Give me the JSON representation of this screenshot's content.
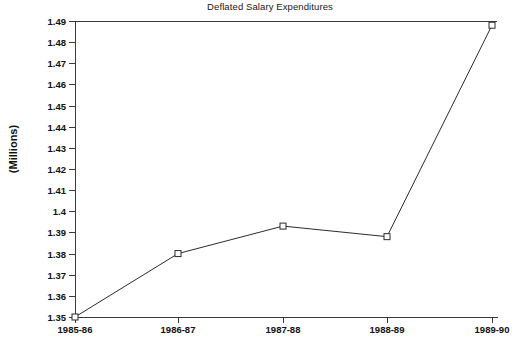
{
  "chart_data": {
    "type": "line",
    "title": "Deflated Salary Expenditures",
    "xlabel": "",
    "ylabel": "(Millions)",
    "categories": [
      "1985-86",
      "1986-87",
      "1987-88",
      "1988-89",
      "1989-90"
    ],
    "values": [
      1.35,
      1.38,
      1.393,
      1.388,
      1.488
    ],
    "series": [
      {
        "name": "Deflated Salary Expenditures",
        "values": [
          1.35,
          1.38,
          1.393,
          1.388,
          1.488
        ]
      }
    ],
    "ylim": [
      1.35,
      1.49
    ],
    "ytick_labels": [
      "1.49",
      "1.48",
      "1.47",
      "1.46",
      "1.45",
      "1.44",
      "1.43",
      "1.42",
      "1.41",
      "1.4",
      "1.39",
      "1.38",
      "1.37",
      "1.36",
      "1.35"
    ],
    "ytick_values": [
      1.49,
      1.48,
      1.47,
      1.46,
      1.45,
      1.44,
      1.43,
      1.42,
      1.41,
      1.4,
      1.39,
      1.38,
      1.37,
      1.36,
      1.35
    ],
    "grid": false,
    "legend": null,
    "marker": "open-square",
    "line_color": "#2b2b2b",
    "axis_color": "#3b3b3b",
    "background": "#ffffff"
  }
}
